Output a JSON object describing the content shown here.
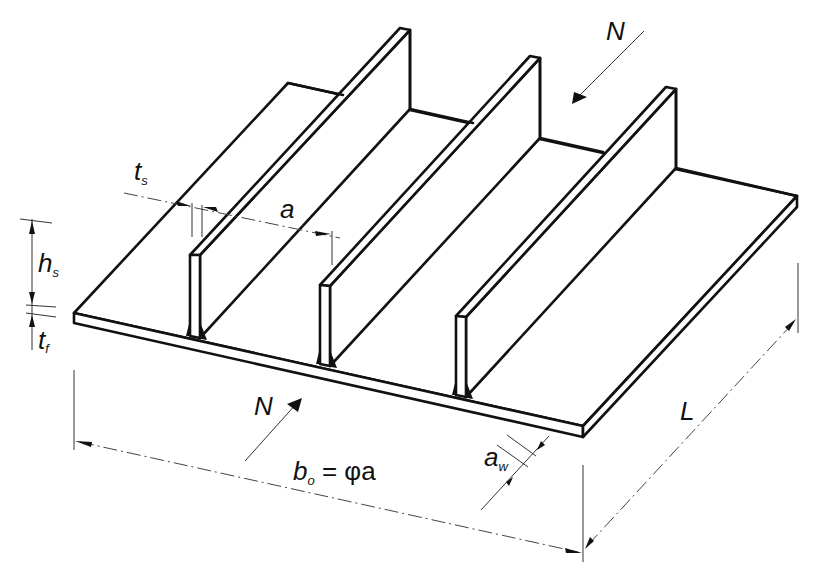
{
  "figure": {
    "stiffener_count": 3
  },
  "labels": {
    "force_top": {
      "main": "N"
    },
    "force_bottom": {
      "main": "N"
    },
    "stiffener_thickness": {
      "main": "t",
      "sub": "s"
    },
    "stiffener_spacing": {
      "main": "a"
    },
    "stiffener_height": {
      "main": "h",
      "sub": "s"
    },
    "plate_thickness": {
      "main": "t",
      "sub": "f"
    },
    "plate_width": {
      "main": "b",
      "sub": "o",
      "rest": " = φa"
    },
    "weld_throat": {
      "main": "a",
      "sub": "w"
    },
    "length": {
      "main": "L"
    }
  },
  "colors": {
    "line": "#111111",
    "background": "#ffffff"
  }
}
